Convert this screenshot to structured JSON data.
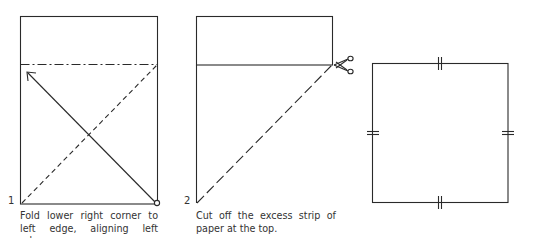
{
  "diagram": {
    "type": "origami-instructions",
    "line_color": "#2a2a2a",
    "steps": [
      {
        "number": "1",
        "caption": "Fold lower right corner to left edge, aligning left edges.",
        "elements": [
          "rectangle",
          "dash-dot fold line",
          "dashed diagonal fold line",
          "arrow from lower right corner to left edge",
          "pivot circle at lower right corner"
        ]
      },
      {
        "number": "2",
        "caption": "Cut off the excess strip of paper at the top.",
        "elements": [
          "folded triangle",
          "strip rectangle",
          "cut line",
          "scissors icon"
        ]
      },
      {
        "number": "",
        "caption": "",
        "elements": [
          "square",
          "equal-length tick marks on all four sides"
        ]
      }
    ]
  }
}
